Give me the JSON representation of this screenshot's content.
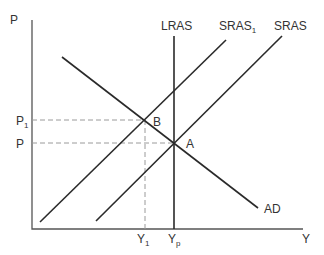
{
  "diagram": {
    "type": "economics-as-ad",
    "axes": {
      "y_label": "P",
      "x_label": "Y"
    },
    "curves": {
      "lras": {
        "label": "LRAS"
      },
      "sras1": {
        "label": "SRAS",
        "sub": "1"
      },
      "sras": {
        "label": "SRAS"
      },
      "ad": {
        "label": "AD"
      }
    },
    "points": {
      "a": {
        "label": "A"
      },
      "b": {
        "label": "B"
      }
    },
    "price_levels": {
      "p1": {
        "label": "P",
        "sub": "1"
      },
      "p": {
        "label": "P"
      }
    },
    "output_levels": {
      "y1": {
        "label": "Y",
        "sub": "1"
      },
      "yp": {
        "label": "Y",
        "sub": "p"
      }
    }
  }
}
